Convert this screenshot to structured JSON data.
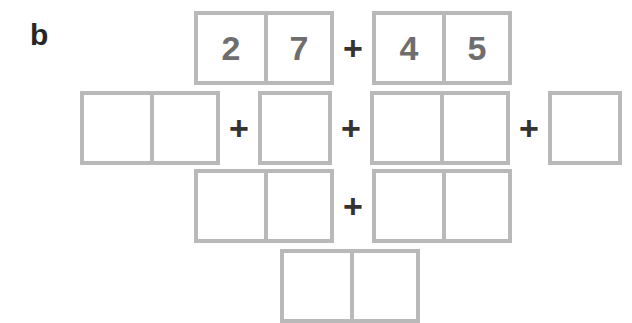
{
  "figure": {
    "panel_label": "b",
    "background_color": "#ffffff",
    "box_border_color": "#b9b9b9",
    "digit_color": "#6e6e6e",
    "operator_color": "#333333",
    "label_color": "#262626"
  },
  "operators": {
    "plus": "+"
  },
  "rows": [
    {
      "id": "row-1",
      "name": "problem-row",
      "items": [
        {
          "type": "box",
          "cells": [
            "2",
            "7"
          ]
        },
        {
          "type": "op",
          "symbol": "+"
        },
        {
          "type": "box",
          "cells": [
            "4",
            "5"
          ]
        }
      ]
    },
    {
      "id": "row-2",
      "name": "decomposition-row",
      "items": [
        {
          "type": "box",
          "cells": [
            "",
            ""
          ]
        },
        {
          "type": "op",
          "symbol": "+"
        },
        {
          "type": "box",
          "cells": [
            ""
          ]
        },
        {
          "type": "op",
          "symbol": "+"
        },
        {
          "type": "box",
          "cells": [
            "",
            ""
          ]
        },
        {
          "type": "op",
          "symbol": "+"
        },
        {
          "type": "box",
          "cells": [
            ""
          ]
        }
      ]
    },
    {
      "id": "row-3",
      "name": "partial-sums-row",
      "items": [
        {
          "type": "box",
          "cells": [
            "",
            ""
          ]
        },
        {
          "type": "op",
          "symbol": "+"
        },
        {
          "type": "box",
          "cells": [
            "",
            ""
          ]
        }
      ]
    },
    {
      "id": "row-4",
      "name": "answer-row",
      "items": [
        {
          "type": "box",
          "cells": [
            "",
            ""
          ]
        }
      ]
    }
  ]
}
